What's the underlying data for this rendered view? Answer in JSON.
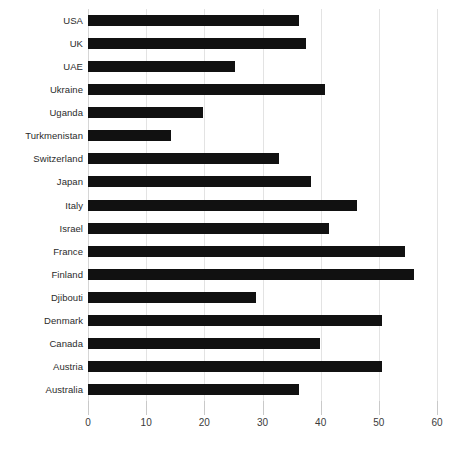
{
  "chart_data": {
    "type": "bar",
    "orientation": "horizontal",
    "title": "",
    "subtitle": "",
    "xlabel": "",
    "ylabel": "",
    "xlim": [
      0,
      60
    ],
    "xticks": [
      0,
      10,
      20,
      30,
      40,
      50,
      60
    ],
    "xtick_labels": [
      "0",
      "10",
      "20",
      "30",
      "40",
      "50",
      "60"
    ],
    "grid": true,
    "grid_axis": "x",
    "legend": false,
    "legend_position": "none",
    "bar_color": "#111111",
    "gridline_color": "#e3e3e3",
    "background_color": "#ffffff",
    "label_color": "#2b2b2b",
    "categories": [
      "USA",
      "UK",
      "UAE",
      "Ukraine",
      "Uganda",
      "Turkmenistan",
      "Switzerland",
      "Japan",
      "Italy",
      "Israel",
      "France",
      "Finland",
      "Djibouti",
      "Denmark",
      "Canada",
      "Austria",
      "Australia"
    ],
    "values": [
      36.3,
      37.5,
      25.2,
      40.8,
      19.7,
      14.3,
      32.9,
      38.4,
      46.2,
      41.5,
      54.5,
      56.0,
      28.8,
      50.6,
      39.8,
      50.5,
      36.2
    ]
  }
}
